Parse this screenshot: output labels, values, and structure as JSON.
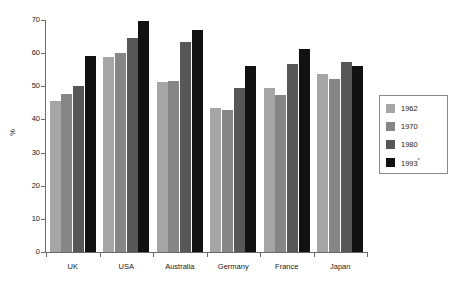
{
  "chart_data": {
    "type": "bar",
    "title": "",
    "subtitle": "",
    "xlabel": "",
    "ylabel": "%",
    "ylim": [
      0,
      70
    ],
    "yticks": [
      0,
      10,
      20,
      30,
      40,
      50,
      60,
      70
    ],
    "grid": false,
    "legend_position": "right",
    "categories": [
      "UK",
      "USA",
      "Australia",
      "Germany",
      "France",
      "Japan"
    ],
    "series": [
      {
        "name": "1962",
        "color": "#a5a5a5",
        "values": [
          45.6,
          58.8,
          51.4,
          43.4,
          49.5,
          53.8
        ]
      },
      {
        "name": "1970",
        "color": "#868686",
        "values": [
          47.8,
          60.0,
          51.6,
          42.9,
          47.4,
          52.1
        ]
      },
      {
        "name": "1980",
        "color": "#575757",
        "values": [
          50.2,
          64.5,
          63.4,
          49.5,
          56.8,
          57.2
        ]
      },
      {
        "name": "1993*",
        "color": "#111111",
        "values": [
          59.2,
          69.8,
          67.1,
          56.0,
          61.4,
          56.2
        ]
      }
    ]
  },
  "legend": {
    "items": [
      {
        "label": "1962",
        "sup": "",
        "color": "#a5a5a5"
      },
      {
        "label": "1970",
        "sup": "",
        "color": "#868686"
      },
      {
        "label": "1980",
        "sup": "",
        "color": "#575757"
      },
      {
        "label": "1993",
        "sup": "*",
        "color": "#111111"
      }
    ]
  },
  "axes": {
    "y_title": "%",
    "y_tick_labels": [
      "0",
      "10",
      "20",
      "30",
      "40",
      "50",
      "60",
      "70"
    ],
    "x_tick_labels": [
      "UK",
      "USA",
      "Australia",
      "Germany",
      "France",
      "Japan"
    ]
  }
}
